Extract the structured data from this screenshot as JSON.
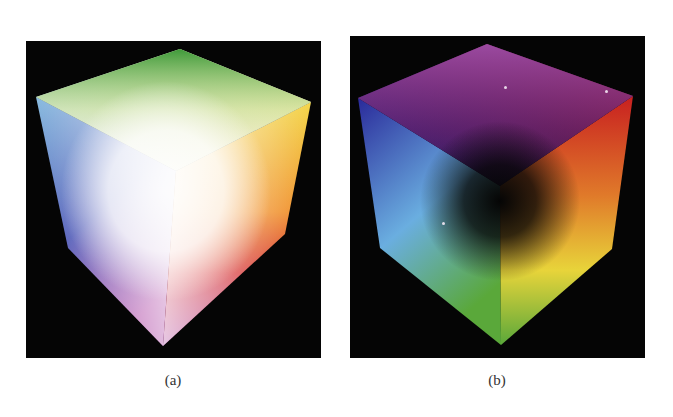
{
  "figure": {
    "panels": [
      {
        "id": "a",
        "caption": "(a)",
        "content": "RGB color cube viewed from the white corner",
        "visible_corner_colors": {
          "top": "#3f9a3a",
          "left": "#7fb6dd",
          "right": "#f2d23a",
          "center": "#ffffff",
          "lower_left": "#3a3fa8",
          "lower_right": "#d42a2a",
          "bottom": "#b04aa8"
        }
      },
      {
        "id": "b",
        "caption": "(b)",
        "content": "RGB color cube viewed from the black corner",
        "visible_corner_colors": {
          "top": "#9a4aa0",
          "left": "#2a2a9a",
          "right": "#c82020",
          "center": "#050505",
          "lower_left": "#6aaee0",
          "lower_right": "#e8d43a",
          "bottom": "#5aa83a"
        }
      }
    ],
    "background_color": "#050505"
  }
}
